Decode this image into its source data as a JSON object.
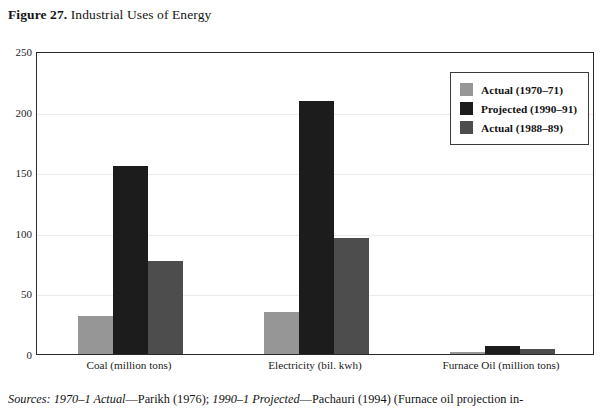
{
  "figure": {
    "label": "Figure 27.",
    "title": "Industrial Uses of Energy"
  },
  "source_note": {
    "lead": "Sources: 1970–1 Actual",
    "dash1": "—Parikh (1976); ",
    "mid": "1990–1 Projected",
    "dash2": "—Pachauri (1994) (Furnace oil projection in-"
  },
  "colors": {
    "actual_1970": "#969696",
    "projected_1990": "#1c1c1c",
    "actual_1988": "#4d4d4d",
    "axis": "#2b2b2b",
    "grid": "#eceaea",
    "background": "#ffffff"
  },
  "chart_data": {
    "type": "bar",
    "title": "Industrial Uses of Energy",
    "xlabel": "",
    "ylabel": "",
    "ylim": [
      0,
      250
    ],
    "yticks": [
      0,
      50,
      100,
      150,
      200,
      250
    ],
    "grid": true,
    "legend_position": "top-right",
    "categories": [
      "Coal (million tons)",
      "Electricity (bil. kwh)",
      "Furnace Oil (million tons)"
    ],
    "series": [
      {
        "name": "Actual (1970–71)",
        "color": "#969696",
        "values": [
          31,
          35,
          2
        ]
      },
      {
        "name": "Projected (1990–91)",
        "color": "#1c1c1c",
        "values": [
          155,
          209,
          7
        ]
      },
      {
        "name": "Actual (1988–89)",
        "color": "#4d4d4d",
        "values": [
          77,
          96,
          4
        ]
      }
    ]
  }
}
